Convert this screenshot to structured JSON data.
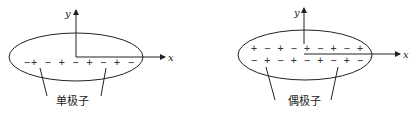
{
  "diagrams": [
    {
      "id": "monopole",
      "label": "单极子",
      "x_axis": "x",
      "y_axis": "y",
      "charges_rows": [
        "−+ − + − + − + −"
      ]
    },
    {
      "id": "dipole",
      "label": "偶极子",
      "x_axis": "x",
      "y_axis": "y",
      "charges_rows": [
        "+ − + − + − + − +",
        "− + − + − + − + −"
      ]
    }
  ]
}
